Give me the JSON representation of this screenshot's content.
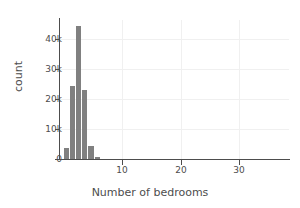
{
  "chart_data": {
    "type": "bar",
    "title": "",
    "xlabel": "Number of bedrooms",
    "ylabel": "count",
    "categories": [
      1,
      2,
      3,
      4,
      5,
      6
    ],
    "values": [
      3500,
      24000,
      44000,
      23000,
      4300,
      600
    ],
    "series": [
      {
        "name": "count",
        "values": [
          3500,
          24000,
          44000,
          23000,
          4300,
          600
        ]
      }
    ],
    "xlim": [
      0,
      37
    ],
    "ylim": [
      0,
      46000
    ],
    "xticks": [
      10,
      20,
      30
    ],
    "xticklabels": [
      "10",
      "20",
      "30"
    ],
    "yticks": [
      0,
      10000,
      20000,
      30000,
      40000
    ],
    "yticklabels": [
      "0",
      "10k",
      "20k",
      "30k",
      "40k"
    ],
    "grid": true,
    "legend": false,
    "bar_color": "#808080",
    "axis_color": "#4d4d4d",
    "grid_color": "#f0f0f0",
    "background": "#ffffff"
  },
  "axes": {
    "x_title": "Number of bedrooms",
    "y_title": "count",
    "y_tick_0": "0",
    "y_tick_1": "10k",
    "y_tick_2": "20k",
    "y_tick_3": "30k",
    "y_tick_4": "40k",
    "x_tick_0": "10",
    "x_tick_1": "20",
    "x_tick_2": "30"
  }
}
